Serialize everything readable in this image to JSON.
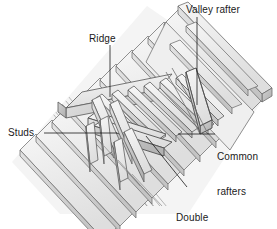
{
  "figure": {
    "type": "technical-line-illustration",
    "background_color": "#ffffff",
    "line_color": "#555555",
    "fill_light": "#f2f2f2",
    "fill_mid": "#e0e0e0",
    "fill_dark": "#c9c9c9",
    "fill_shadow": "#b5b5b5",
    "text_color": "#1a1a1a"
  },
  "labels": {
    "valley_rafter": "Valley rafter",
    "ridge": "Ridge",
    "studs": "Studs",
    "common_rafters_line1": "Common",
    "common_rafters_line2": "rafters",
    "double_header_line1": "Double",
    "double_header_line2": "header"
  },
  "leaders": {
    "valley_rafter": "vertical leader from label down to valley rafter member",
    "ridge": "vertical leader from label down to ridge board",
    "studs": "horizontal leader from label right to stud member",
    "common_rafters": "horizontal leader from label left to common rafter",
    "double_header": "diagonal leader from label up-left to double header"
  }
}
